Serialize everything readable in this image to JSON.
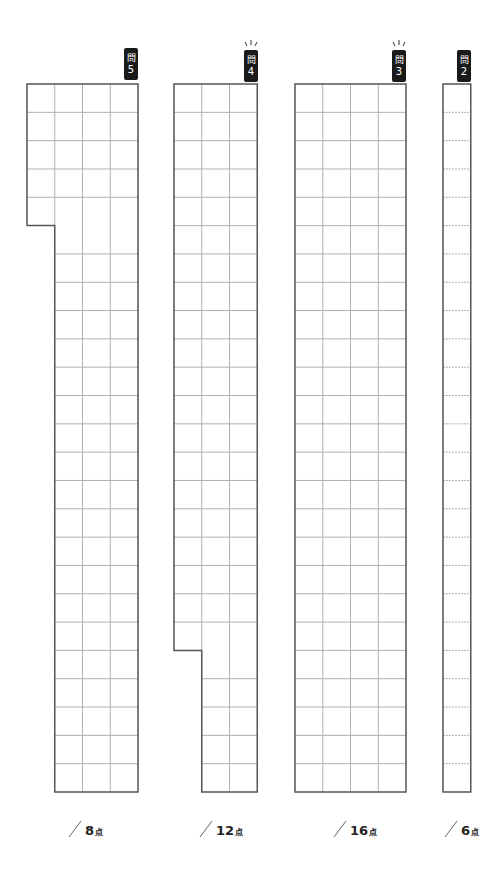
{
  "sheet": {
    "row_height": 28.32,
    "cell_width": 27.75,
    "top": 84,
    "bottom": 792,
    "rows": 25,
    "line_color": "#555555",
    "grid_color": "#b0b0b0"
  },
  "questions": [
    {
      "id": "q5",
      "badge_kanji": "問",
      "badge_number": "5",
      "has_sparkle": false,
      "score": "8",
      "unit": "点",
      "left": 27,
      "cols": 4,
      "notch": {
        "side": "left-bottom",
        "full_rows": 5,
        "missing_cols": 1
      }
    },
    {
      "id": "q4",
      "badge_kanji": "問",
      "badge_number": "4",
      "has_sparkle": true,
      "score": "12",
      "unit": "点",
      "left": 174,
      "cols": 3,
      "notch": {
        "side": "left-bottom",
        "full_rows": 20,
        "missing_cols": 1
      }
    },
    {
      "id": "q3",
      "badge_kanji": "問",
      "badge_number": "3",
      "has_sparkle": true,
      "score": "16",
      "unit": "点",
      "left": 295,
      "cols": 4,
      "notch": null
    },
    {
      "id": "q2",
      "badge_kanji": "問",
      "badge_number": "2",
      "has_sparkle": false,
      "score": "6",
      "unit": "点",
      "left": 443,
      "cols": 1,
      "notch": null
    }
  ]
}
